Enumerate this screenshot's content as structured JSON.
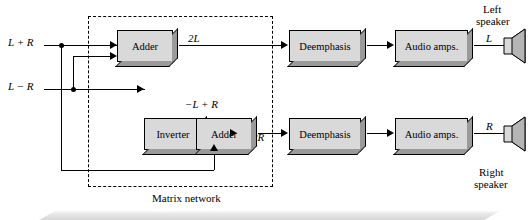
{
  "figure": {
    "inputs": [
      {
        "label": "L + R"
      },
      {
        "label": "L − R"
      }
    ],
    "blocks": [
      {
        "id": "adder-top",
        "label": "Adder"
      },
      {
        "id": "inverter",
        "label": "Inverter"
      },
      {
        "id": "adder-bottom",
        "label": "Adder"
      },
      {
        "id": "deemphasis-top",
        "label": "Deemphasis"
      },
      {
        "id": "deemphasis-bottom",
        "label": "Deemphasis"
      },
      {
        "id": "audio-amps-top",
        "label": "Audio amps."
      },
      {
        "id": "audio-amps-bottom",
        "label": "Audio amps."
      }
    ],
    "wire_labels": [
      {
        "id": "two-l",
        "text": "2L"
      },
      {
        "id": "minus-l-plus-r",
        "text": "−L + R"
      },
      {
        "id": "two-r",
        "text": "2R"
      },
      {
        "id": "left-channel",
        "text": "L"
      },
      {
        "id": "right-channel",
        "text": "R"
      }
    ],
    "group_label": "Matrix network",
    "speakers": [
      {
        "id": "left-speaker",
        "line1": "Left",
        "line2": "speaker"
      },
      {
        "id": "right-speaker",
        "line1": "Right",
        "line2": "speaker"
      }
    ],
    "colors": {
      "block_face": "#d9d9d9",
      "block_shade": "#9a9a9a",
      "line": "#000000",
      "background": "#ffffff"
    }
  }
}
